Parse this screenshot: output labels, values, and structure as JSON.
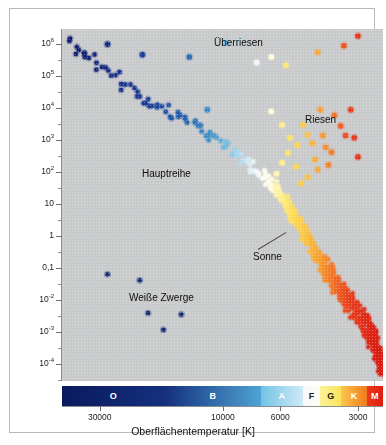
{
  "figure": {
    "plot_bg": "#c9cacb",
    "frame_border": "#b9b9b9"
  },
  "yaxis": {
    "title": "Leuchtkraft in Einheiten der Sonnenleuchtkraft",
    "ticks": [
      "10",
      "10",
      "10",
      "10",
      "10",
      "10",
      "1",
      "0,1",
      "10",
      "10",
      "10"
    ],
    "tick_labels": [
      {
        "base": "10",
        "exp": "6",
        "value": 1000000
      },
      {
        "base": "10",
        "exp": "5",
        "value": 100000
      },
      {
        "base": "10",
        "exp": "4",
        "value": 10000
      },
      {
        "base": "10",
        "exp": "3",
        "value": 1000
      },
      {
        "base": "10",
        "exp": "2",
        "value": 100
      },
      {
        "base": "10",
        "exp": "",
        "value": 10
      },
      {
        "base": "1",
        "exp": "",
        "value": 1
      },
      {
        "base": "0,1",
        "exp": "",
        "value": 0.1
      },
      {
        "base": "10",
        "exp": "-2",
        "value": 0.01
      },
      {
        "base": "10",
        "exp": "-3",
        "value": 0.001
      },
      {
        "base": "10",
        "exp": "-4",
        "value": 0.0001
      }
    ]
  },
  "xaxis": {
    "title": "Oberflächentemperatur [K]",
    "tick_labels": [
      "30000",
      "10000",
      "6000",
      "3000"
    ],
    "tick_values": [
      30000,
      10000,
      6000,
      3000
    ]
  },
  "spectral_bar": {
    "classes": [
      {
        "label": "O",
        "color_start": "#0a1a5e",
        "color_end": "#14307e",
        "text_color": "#ffffff",
        "width_pct": 32.0
      },
      {
        "label": "B",
        "color_start": "#14307e",
        "color_end": "#4ea3d4",
        "text_color": "#ffffff",
        "width_pct": 30.0
      },
      {
        "label": "A",
        "color_start": "#72c3e4",
        "color_end": "#cfeaf6",
        "text_color": "#ffffff",
        "width_pct": 13.0
      },
      {
        "label": "F",
        "color_start": "#f7f9fb",
        "color_end": "#fdfdf4",
        "text_color": "#1a1a1a",
        "width_pct": 5.5
      },
      {
        "label": "G",
        "color_start": "#fbf39a",
        "color_end": "#fbe25c",
        "text_color": "#1a1a1a",
        "width_pct": 6.5
      },
      {
        "label": "K",
        "color_start": "#fbc949",
        "color_end": "#f07a22",
        "text_color": "#ffffff",
        "width_pct": 8.0
      },
      {
        "label": "M",
        "color_start": "#ea3a1c",
        "color_end": "#df1e10",
        "text_color": "#ffffff",
        "width_pct": 5.0
      }
    ]
  },
  "annotations": [
    {
      "name": "ueberriesen",
      "text": "Überriesen",
      "x": 204,
      "y": 28
    },
    {
      "name": "riesen",
      "text": "Riesen",
      "x": 295,
      "y": 105
    },
    {
      "name": "hauptreihe",
      "text": "Hauptreihe",
      "x": 132,
      "y": 159
    },
    {
      "name": "sonne",
      "text": "Sonne",
      "x": 243,
      "y": 242
    },
    {
      "name": "weisse-zwerge",
      "text": "Weiße Zwerge",
      "x": 119,
      "y": 283
    }
  ],
  "sun_pointer": {
    "x1": 248,
    "y1": 240,
    "x2": 276,
    "y2": 223
  },
  "chart_data": {
    "type": "scatter",
    "xlabel": "Oberflächentemperatur [K]",
    "ylabel": "Leuchtkraft in Einheiten der Sonnenleuchtkraft",
    "xlim": [
      42000,
      2400
    ],
    "ylim": [
      3e-05,
      3000000
    ],
    "xscale": "log-reversed",
    "yscale": "log",
    "grid": false,
    "legend": "none",
    "groups": [
      {
        "name": "Hauptreihe",
        "label": "Main sequence",
        "points": [
          [
            40000,
            1800000
          ],
          [
            37000,
            700000
          ],
          [
            35000,
            550000
          ],
          [
            33500,
            420000
          ],
          [
            32000,
            330000
          ],
          [
            30500,
            190000
          ],
          [
            28800,
            150000
          ],
          [
            27500,
            110000
          ],
          [
            26000,
            92000
          ],
          [
            24800,
            55000
          ],
          [
            23500,
            40000
          ],
          [
            22000,
            32000
          ],
          [
            21000,
            26000
          ],
          [
            20000,
            20000
          ],
          [
            19000,
            15000
          ],
          [
            18200,
            12000
          ],
          [
            17400,
            10500
          ],
          [
            16600,
            9000
          ],
          [
            15800,
            7000
          ],
          [
            15000,
            6200
          ],
          [
            14300,
            4800
          ],
          [
            13700,
            4000
          ],
          [
            13100,
            3200
          ],
          [
            12600,
            2600
          ],
          [
            12100,
            2100
          ],
          [
            11600,
            1700
          ],
          [
            11100,
            1400
          ],
          [
            10700,
            1100
          ],
          [
            10300,
            900
          ],
          [
            9900,
            720
          ],
          [
            9550,
            600
          ],
          [
            9200,
            480
          ],
          [
            8900,
            380
          ],
          [
            8600,
            320
          ],
          [
            8350,
            250
          ],
          [
            8100,
            205
          ],
          [
            7870,
            170
          ],
          [
            7650,
            140
          ],
          [
            7440,
            115
          ],
          [
            7240,
            95
          ],
          [
            7050,
            78
          ],
          [
            6880,
            64
          ],
          [
            6710,
            53
          ],
          [
            6550,
            44
          ],
          [
            6400,
            36
          ],
          [
            6260,
            29
          ],
          [
            6130,
            24
          ],
          [
            6010,
            20
          ],
          [
            5890,
            16
          ],
          [
            5780,
            13
          ],
          [
            5670,
            10
          ],
          [
            5570,
            8
          ],
          [
            5470,
            6.5
          ],
          [
            5380,
            5.2
          ],
          [
            5290,
            4.2
          ],
          [
            5200,
            3.4
          ],
          [
            5120,
            2.7
          ],
          [
            5040,
            2.2
          ],
          [
            4960,
            1.7
          ],
          [
            4880,
            1.4
          ],
          [
            4800,
            1.15
          ],
          [
            4730,
            0.92
          ],
          [
            4660,
            0.74
          ],
          [
            4590,
            0.6
          ],
          [
            4520,
            0.48
          ],
          [
            4450,
            0.39
          ],
          [
            4380,
            0.31
          ],
          [
            4310,
            0.25
          ],
          [
            4240,
            0.2
          ],
          [
            4170,
            0.16
          ],
          [
            4100,
            0.13
          ],
          [
            4030,
            0.105
          ],
          [
            3960,
            0.085
          ],
          [
            3890,
            0.068
          ],
          [
            3820,
            0.055
          ],
          [
            3750,
            0.044
          ],
          [
            3680,
            0.035
          ],
          [
            3610,
            0.028
          ],
          [
            3540,
            0.022
          ],
          [
            3470,
            0.018
          ],
          [
            3400,
            0.014
          ],
          [
            3330,
            0.011
          ],
          [
            3260,
            0.009
          ],
          [
            3190,
            0.0072
          ],
          [
            3120,
            0.0058
          ],
          [
            3050,
            0.0046
          ],
          [
            2990,
            0.0037
          ],
          [
            2930,
            0.0029
          ],
          [
            2880,
            0.0023
          ],
          [
            2830,
            0.0018
          ],
          [
            2780,
            0.0015
          ],
          [
            2730,
            0.0011
          ],
          [
            2690,
            0.0009
          ],
          [
            2650,
            0.0007
          ],
          [
            2610,
            0.00055
          ],
          [
            2570,
            0.00043
          ],
          [
            2540,
            0.00034
          ],
          [
            2510,
            0.00026
          ],
          [
            2480,
            0.0002
          ],
          [
            2450,
            0.00014
          ],
          [
            2430,
            0.0001
          ],
          [
            2420,
            7e-05
          ]
        ]
      },
      {
        "name": "Überriesen",
        "label": "Supergiants",
        "points": [
          [
            28000,
            1000000
          ],
          [
            20500,
            470000
          ],
          [
            13500,
            400000
          ],
          [
            9700,
            1100000
          ],
          [
            8600,
            1300000
          ],
          [
            7400,
            270000
          ],
          [
            6500,
            400000
          ],
          [
            5700,
            220000
          ],
          [
            4300,
            560000
          ],
          [
            3400,
            900000
          ],
          [
            3000,
            1800000
          ],
          [
            11500,
            9000
          ]
        ]
      },
      {
        "name": "Riesen",
        "label": "Giants",
        "points": [
          [
            6500,
            8000
          ],
          [
            5900,
            3000
          ],
          [
            5500,
            1200
          ],
          [
            5150,
            700
          ],
          [
            5600,
            400
          ],
          [
            5900,
            200
          ],
          [
            6200,
            90
          ],
          [
            5200,
            150
          ],
          [
            4900,
            3000
          ],
          [
            4700,
            1500
          ],
          [
            4500,
            800
          ],
          [
            4400,
            250
          ],
          [
            4200,
            9000
          ],
          [
            4100,
            1400
          ],
          [
            4000,
            600
          ],
          [
            3900,
            170
          ],
          [
            3700,
            6000
          ],
          [
            3500,
            2800
          ],
          [
            3350,
            1400
          ],
          [
            3200,
            9000
          ],
          [
            3100,
            1200
          ],
          [
            3000,
            300
          ],
          [
            4700,
            70
          ],
          [
            5000,
            45
          ],
          [
            4300,
            120
          ],
          [
            3800,
            420
          ]
        ]
      },
      {
        "name": "Weiße Zwerge",
        "label": "White dwarfs",
        "points": [
          [
            28000,
            0.065
          ],
          [
            21000,
            0.042
          ],
          [
            19500,
            0.004
          ],
          [
            17000,
            0.0012
          ],
          [
            14500,
            0.0036
          ]
        ]
      }
    ]
  }
}
